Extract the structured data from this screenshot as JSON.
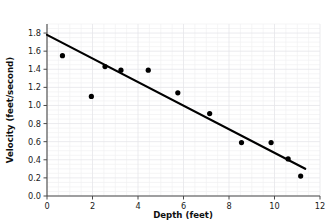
{
  "chart_data": {
    "type": "scatter",
    "title": "",
    "xlabel": "Depth (feet)",
    "ylabel": "Velocity (feet/second)",
    "xlim": [
      0,
      12
    ],
    "ylim": [
      0.0,
      1.9
    ],
    "xticks": [
      "0",
      "2",
      "4",
      "6",
      "8",
      "10",
      "12"
    ],
    "xtick_values": [
      0,
      2,
      4,
      6,
      8,
      10,
      12
    ],
    "yticks": [
      "0.0",
      "0.2",
      "0.4",
      "0.6",
      "0.8",
      "1.0",
      "1.2",
      "1.4",
      "1.6",
      "1.8"
    ],
    "ytick_values": [
      0.0,
      0.2,
      0.4,
      0.6,
      0.8,
      1.0,
      1.2,
      1.4,
      1.6,
      1.8
    ],
    "grid": true,
    "legend": "none",
    "point_color": "#000000",
    "line_color": "#000000",
    "grid_color": "#ededf0",
    "axis_color": "#4a4a4a",
    "series": [
      {
        "name": "Measurements",
        "marker": "circle",
        "x": [
          0.68,
          1.95,
          2.55,
          3.25,
          4.45,
          5.75,
          7.15,
          8.55,
          9.85,
          10.6,
          11.15
        ],
        "y": [
          1.55,
          1.1,
          1.43,
          1.39,
          1.39,
          1.14,
          0.91,
          0.59,
          0.59,
          0.41,
          0.22
        ]
      }
    ],
    "trendline": {
      "name": "Line of best fit",
      "x": [
        0.0,
        11.35
      ],
      "y": [
        1.78,
        0.3
      ]
    }
  }
}
